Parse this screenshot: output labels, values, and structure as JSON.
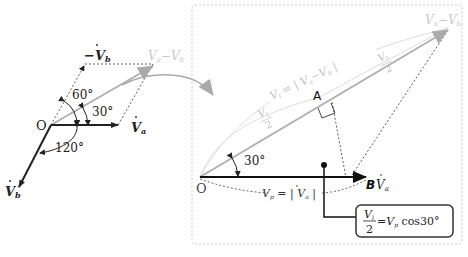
{
  "left_diagram": {
    "origin_label": "O",
    "vectors": {
      "va": {
        "label": "V",
        "sub": "a",
        "color": "#222222"
      },
      "vb": {
        "label": "V",
        "sub": "b",
        "color": "#222222"
      },
      "neg_vb": {
        "label": "−V",
        "sub": "b",
        "color": "#222222"
      },
      "diff": {
        "label": "V",
        "sub_a": "a",
        "minus": "−",
        "label2": "V",
        "sub_b": "b",
        "color": "#b0b0b0"
      }
    },
    "angles": {
      "a60": "60°",
      "a30": "30°",
      "a120": "120°"
    }
  },
  "right_diagram": {
    "origin_label": "O",
    "point_a": "A",
    "point_b": "B",
    "angle": "30°",
    "va_label": {
      "v": "V",
      "sub": "a"
    },
    "diff_label": {
      "v1": "V",
      "s1": "a",
      "minus": "−",
      "v2": "V",
      "s2": "b"
    },
    "vl_eq": {
      "v": "V",
      "sub": "l",
      "eq": " = | ",
      "v2": "V",
      "s2": "a",
      "minus": "−",
      "v3": "V",
      "s3": "b",
      "close": " |"
    },
    "half_label": {
      "num_v": "V",
      "num_sub": "l",
      "den": "2"
    },
    "vp_eq": {
      "v": "V",
      "sub": "p",
      "eq": " = | ",
      "v2": "V",
      "s2": "a",
      "close": " |"
    },
    "formula": {
      "num_v": "V",
      "num_sub": "l",
      "den": "2",
      "rhs": "=V",
      "rhs_sub": "p",
      "rhs_tail": " cos30°"
    }
  },
  "colors": {
    "dark": "#222222",
    "gray_vector": "#b0b0b0",
    "light_label": "#c8c8c8",
    "dotted_box": "#c8c8c8",
    "curve_arrow": "#aaaaaa"
  }
}
